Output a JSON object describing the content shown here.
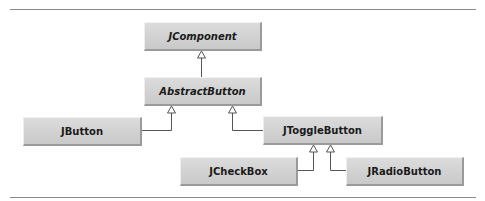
{
  "diagram": {
    "type": "class-hierarchy",
    "nodes": [
      {
        "id": "jcomponent",
        "label": "JComponent",
        "abstract": true
      },
      {
        "id": "abstractbutton",
        "label": "AbstractButton",
        "abstract": true
      },
      {
        "id": "jbutton",
        "label": "JButton",
        "abstract": false
      },
      {
        "id": "jtogglebutton",
        "label": "JToggleButton",
        "abstract": false
      },
      {
        "id": "jcheckbox",
        "label": "JCheckBox",
        "abstract": false
      },
      {
        "id": "jradiobutton",
        "label": "JRadioButton",
        "abstract": false
      }
    ],
    "edges": [
      {
        "from": "AbstractButton",
        "to": "JComponent",
        "kind": "inheritance"
      },
      {
        "from": "JButton",
        "to": "AbstractButton",
        "kind": "inheritance"
      },
      {
        "from": "JToggleButton",
        "to": "AbstractButton",
        "kind": "inheritance"
      },
      {
        "from": "JCheckBox",
        "to": "JToggleButton",
        "kind": "inheritance"
      },
      {
        "from": "JRadioButton",
        "to": "JToggleButton",
        "kind": "inheritance"
      }
    ],
    "colors": {
      "node_fill": "#d3d3d3",
      "line": "#555555",
      "rule": "#8a8a8a"
    }
  }
}
